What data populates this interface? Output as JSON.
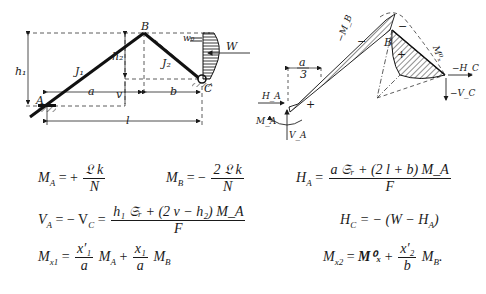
{
  "figure_left": {
    "points": {
      "A": "A",
      "B": "B",
      "C": "C"
    },
    "members": {
      "J1": "J₁",
      "J2": "J₂"
    },
    "dims": {
      "h1": "h₁",
      "h2": "h₂",
      "v": "v",
      "a": "a",
      "b": "b",
      "l": "l"
    },
    "load": {
      "W": "W",
      "w0": "w₀"
    }
  },
  "figure_right": {
    "labels": {
      "B": "B",
      "a_over_3_num": "a",
      "a_over_3_den": "3",
      "HA": "H_A",
      "MA": "M_A",
      "VA": "V_A",
      "HC": "−H_C",
      "VC": "−V_C",
      "MB": "−M_B",
      "Mx0": "M⁰ₓ",
      "Mx0_left": "M⁰",
      "plus": "+",
      "minus": "−"
    }
  },
  "equations": {
    "MA": {
      "lhs": "M",
      "lhs_sub": "A",
      "op": "= +",
      "num": "𝔏 k",
      "den": "N"
    },
    "MB": {
      "lhs": "M",
      "lhs_sub": "B",
      "op": "= −",
      "num": "2 𝔏 k",
      "den": "N"
    },
    "HA": {
      "lhs": "H",
      "lhs_sub": "A",
      "op": "=",
      "num": "a 𝔖ᵣ + (2 l + b) M_A",
      "den": "F"
    },
    "VA": {
      "lhs": "V",
      "lhs_sub": "A",
      "op": "= − V",
      "op_sub": "C",
      "op2": "=",
      "num": "h₁ 𝔖ᵣ + (2 v − h₂) M_A",
      "den": "F"
    },
    "HC": {
      "text": "H",
      "sub": "C",
      "rest": "= − (W − H",
      "sub2": "A",
      "end": ")"
    },
    "Mx1": {
      "lhs": "M",
      "lhs_sub": "x1",
      "op": "=",
      "f1_num": "x′₁",
      "f1_den": "a",
      "t1": "M",
      "t1_sub": "A",
      "plus": "+",
      "f2_num": "x₁",
      "f2_den": "a",
      "t2": "M",
      "t2_sub": "B"
    },
    "Mx2": {
      "lhs": "M",
      "lhs_sub": "x2",
      "op": "=",
      "t0": "M⁰ₓ",
      "plus": "+",
      "f_num": "x′₂",
      "f_den": "b",
      "t1": "M",
      "t1_sub": "B",
      "end": "."
    }
  }
}
